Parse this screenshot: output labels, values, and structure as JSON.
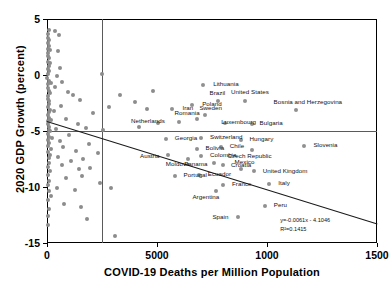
{
  "chart_data": {
    "type": "scatter",
    "title": "",
    "xlabel": "COVID-19 Deaths per Million Population",
    "ylabel": "2020 GDP Growth (percent)",
    "xlim": [
      0,
      1500
    ],
    "ylim": [
      -15,
      5
    ],
    "xticks": [
      "0",
      "5000",
      "1000",
      "1500"
    ],
    "xtick_values": [
      0,
      500,
      1000,
      1500
    ],
    "yticks": [
      "5",
      "0",
      "-5",
      "-10",
      "-15"
    ],
    "ytick_values": [
      5,
      0,
      -5,
      -10,
      -15
    ],
    "grid": false,
    "legend": null,
    "annotations": {
      "equation": "y=-0.0061x - 4.1046",
      "r_squared": "R²=0.1415"
    },
    "reference_lines": [
      {
        "orientation": "vertical",
        "value": 250
      },
      {
        "orientation": "horizontal",
        "value": -5
      }
    ],
    "trendline": {
      "slope": -0.0061,
      "intercept": -4.1046,
      "r2": 0.1415
    },
    "labeled_points": [
      {
        "label": "Lithuania",
        "x": 710,
        "y": -0.9,
        "lx": 10,
        "ly": -4
      },
      {
        "label": "Iran",
        "x": 570,
        "y": -3.0,
        "lx": 10,
        "ly": -4
      },
      {
        "label": "Poland",
        "x": 660,
        "y": -2.7,
        "lx": 10,
        "ly": -4
      },
      {
        "label": "Brazil",
        "x": 775,
        "y": -2.3,
        "lx": -8,
        "ly": -11
      },
      {
        "label": "United States",
        "x": 900,
        "y": -2.3,
        "lx": -14,
        "ly": -12
      },
      {
        "label": "Bosnia and Herzegovina",
        "x": 1130,
        "y": -3.1,
        "lx": -22,
        "ly": -11
      },
      {
        "label": "Sweden",
        "x": 720,
        "y": -3.6,
        "lx": -6,
        "ly": -10
      },
      {
        "label": "Romania",
        "x": 680,
        "y": -3.9,
        "lx": -22,
        "ly": -9
      },
      {
        "label": "Netherlands",
        "x": 600,
        "y": -4.2,
        "lx": -48,
        "ly": -4
      },
      {
        "label": "Luxembourg",
        "x": 810,
        "y": -4.3,
        "lx": -4,
        "ly": -4
      },
      {
        "label": "Bulgaria",
        "x": 930,
        "y": -4.4,
        "lx": 8,
        "ly": -4
      },
      {
        "label": "Georgia",
        "x": 540,
        "y": -5.7,
        "lx": 9,
        "ly": -4
      },
      {
        "label": "Switzerland",
        "x": 700,
        "y": -5.6,
        "lx": 9,
        "ly": -4
      },
      {
        "label": "Hungary",
        "x": 880,
        "y": -5.8,
        "lx": 9,
        "ly": -4
      },
      {
        "label": "Bolivia",
        "x": 680,
        "y": -6.6,
        "lx": 9,
        "ly": -4
      },
      {
        "label": "Chile",
        "x": 790,
        "y": -6.4,
        "lx": 9,
        "ly": -4
      },
      {
        "label": "Czech Republic",
        "x": 930,
        "y": -6.7,
        "lx": -24,
        "ly": 3
      },
      {
        "label": "Slovenia",
        "x": 1170,
        "y": -6.3,
        "lx": 9,
        "ly": -4
      },
      {
        "label": "Austria",
        "x": 550,
        "y": -7.1,
        "lx": -28,
        "ly": -2
      },
      {
        "label": "Moldova",
        "x": 640,
        "y": -7.5,
        "lx": -22,
        "ly": 2
      },
      {
        "label": "Colombia",
        "x": 700,
        "y": -7.2,
        "lx": 9,
        "ly": -4
      },
      {
        "label": "Panama",
        "x": 760,
        "y": -7.9,
        "lx": -30,
        "ly": -2
      },
      {
        "label": "Croatia",
        "x": 800,
        "y": -8.0,
        "lx": 8,
        "ly": -3
      },
      {
        "label": "Mexico",
        "x": 880,
        "y": -8.4,
        "lx": -6,
        "ly": -10
      },
      {
        "label": "Ecuador",
        "x": 690,
        "y": -8.9,
        "lx": 9,
        "ly": -4
      },
      {
        "label": "Portugal",
        "x": 580,
        "y": -9.0,
        "lx": 9,
        "ly": -4
      },
      {
        "label": "United Kingdom",
        "x": 940,
        "y": -8.6,
        "lx": 9,
        "ly": -3
      },
      {
        "label": "France",
        "x": 800,
        "y": -9.8,
        "lx": 9,
        "ly": -4
      },
      {
        "label": "Argentina",
        "x": 770,
        "y": -10.4,
        "lx": -24,
        "ly": 3
      },
      {
        "label": "Italy",
        "x": 1010,
        "y": -9.7,
        "lx": 9,
        "ly": -4
      },
      {
        "label": "Peru",
        "x": 990,
        "y": -11.7,
        "lx": 9,
        "ly": -4
      },
      {
        "label": "Spain",
        "x": 870,
        "y": -12.7,
        "lx": -26,
        "ly": -3
      }
    ],
    "unlabeled_points": [
      {
        "x": 8,
        "y": 4.0
      },
      {
        "x": 6,
        "y": 3.7
      },
      {
        "x": 5,
        "y": 3.3
      },
      {
        "x": 10,
        "y": 3.1
      },
      {
        "x": 38,
        "y": 3.9
      },
      {
        "x": 55,
        "y": 3.6
      },
      {
        "x": 4,
        "y": 2.9
      },
      {
        "x": 7,
        "y": 2.6
      },
      {
        "x": 3,
        "y": 2.3
      },
      {
        "x": 12,
        "y": 2.2
      },
      {
        "x": 6,
        "y": 2.0
      },
      {
        "x": 48,
        "y": 2.1
      },
      {
        "x": 5,
        "y": 1.7
      },
      {
        "x": 9,
        "y": 1.5
      },
      {
        "x": 3,
        "y": 1.2
      },
      {
        "x": 14,
        "y": 1.1
      },
      {
        "x": 7,
        "y": 0.8
      },
      {
        "x": 4,
        "y": 0.5
      },
      {
        "x": 11,
        "y": 0.4
      },
      {
        "x": 6,
        "y": 0.1
      },
      {
        "x": 60,
        "y": 0.6
      },
      {
        "x": 44,
        "y": -0.1
      },
      {
        "x": 250,
        "y": 0.1
      },
      {
        "x": 2,
        "y": -0.3
      },
      {
        "x": 9,
        "y": -0.5
      },
      {
        "x": 5,
        "y": -0.8
      },
      {
        "x": 16,
        "y": -0.7
      },
      {
        "x": 70,
        "y": -0.6
      },
      {
        "x": 35,
        "y": -1.1
      },
      {
        "x": 3,
        "y": -1.2
      },
      {
        "x": 8,
        "y": -1.4
      },
      {
        "x": 13,
        "y": -1.6
      },
      {
        "x": 6,
        "y": -1.9
      },
      {
        "x": 95,
        "y": -1.5
      },
      {
        "x": 120,
        "y": -1.8
      },
      {
        "x": 4,
        "y": -2.1
      },
      {
        "x": 10,
        "y": -2.3
      },
      {
        "x": 7,
        "y": -2.6
      },
      {
        "x": 150,
        "y": -2.2
      },
      {
        "x": 64,
        "y": -2.8
      },
      {
        "x": 3,
        "y": -2.9
      },
      {
        "x": 12,
        "y": -3.1
      },
      {
        "x": 8,
        "y": -3.3
      },
      {
        "x": 30,
        "y": -3.2
      },
      {
        "x": 210,
        "y": -3.4
      },
      {
        "x": 280,
        "y": -2.9
      },
      {
        "x": 330,
        "y": -1.8
      },
      {
        "x": 400,
        "y": -2.4
      },
      {
        "x": 455,
        "y": -3.0
      },
      {
        "x": 480,
        "y": -1.4
      },
      {
        "x": 5,
        "y": -3.6
      },
      {
        "x": 11,
        "y": -3.8
      },
      {
        "x": 6,
        "y": -4.1
      },
      {
        "x": 18,
        "y": -4.0
      },
      {
        "x": 85,
        "y": -3.9
      },
      {
        "x": 140,
        "y": -4.4
      },
      {
        "x": 3,
        "y": -4.4
      },
      {
        "x": 9,
        "y": -4.6
      },
      {
        "x": 7,
        "y": -4.9
      },
      {
        "x": 14,
        "y": -5.0
      },
      {
        "x": 40,
        "y": -4.8
      },
      {
        "x": 175,
        "y": -4.7
      },
      {
        "x": 255,
        "y": -4.9
      },
      {
        "x": 420,
        "y": -4.6
      },
      {
        "x": 505,
        "y": -4.3
      },
      {
        "x": 4,
        "y": -5.3
      },
      {
        "x": 10,
        "y": -5.5
      },
      {
        "x": 6,
        "y": -5.8
      },
      {
        "x": 22,
        "y": -5.6
      },
      {
        "x": 58,
        "y": -5.9
      },
      {
        "x": 100,
        "y": -5.4
      },
      {
        "x": 8,
        "y": -6.1
      },
      {
        "x": 3,
        "y": -6.3
      },
      {
        "x": 16,
        "y": -6.6
      },
      {
        "x": 72,
        "y": -6.4
      },
      {
        "x": 130,
        "y": -6.8
      },
      {
        "x": 190,
        "y": -6.2
      },
      {
        "x": 5,
        "y": -6.9
      },
      {
        "x": 12,
        "y": -7.1
      },
      {
        "x": 7,
        "y": -7.4
      },
      {
        "x": 50,
        "y": -7.3
      },
      {
        "x": 110,
        "y": -7.7
      },
      {
        "x": 165,
        "y": -7.5
      },
      {
        "x": 230,
        "y": -7.0
      },
      {
        "x": 9,
        "y": -7.9
      },
      {
        "x": 4,
        "y": -8.2
      },
      {
        "x": 66,
        "y": -8.0
      },
      {
        "x": 145,
        "y": -8.4
      },
      {
        "x": 195,
        "y": -8.3
      },
      {
        "x": 13,
        "y": -8.6
      },
      {
        "x": 6,
        "y": -8.9
      },
      {
        "x": 88,
        "y": -9.2
      },
      {
        "x": 160,
        "y": -9.0
      },
      {
        "x": 240,
        "y": -9.6
      },
      {
        "x": 10,
        "y": -9.5
      },
      {
        "x": 3,
        "y": -9.8
      },
      {
        "x": 44,
        "y": -10.1
      },
      {
        "x": 125,
        "y": -10.3
      },
      {
        "x": 8,
        "y": -10.4
      },
      {
        "x": 20,
        "y": -10.8
      },
      {
        "x": 290,
        "y": -10.1
      },
      {
        "x": 5,
        "y": -11.2
      },
      {
        "x": 78,
        "y": -11.5
      },
      {
        "x": 155,
        "y": -11.8
      },
      {
        "x": 11,
        "y": -12.0
      },
      {
        "x": 4,
        "y": -12.6
      },
      {
        "x": 180,
        "y": -12.9
      },
      {
        "x": 6,
        "y": -13.4
      },
      {
        "x": 310,
        "y": -14.4
      }
    ]
  }
}
